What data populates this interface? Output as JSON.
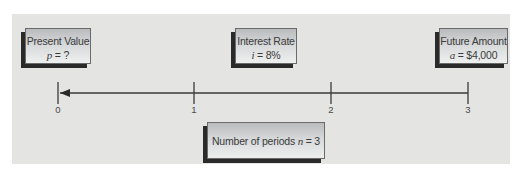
{
  "diagram": {
    "type": "time-value-of-money timeline",
    "boxes": {
      "present_value": {
        "title": "Present Value",
        "var": "p",
        "rest": " = ?"
      },
      "interest_rate": {
        "title": "Interest Rate",
        "var": "i",
        "rest": " = 8%"
      },
      "future_amount": {
        "title": "Future Amount",
        "var": "a",
        "rest": " = $4,000"
      },
      "periods": {
        "prefix": "Number of periods ",
        "var": "n",
        "rest": " = 3"
      }
    },
    "timeline": {
      "ticks": [
        "0",
        "1",
        "2",
        "3"
      ],
      "arrow_direction": "right-to-left"
    },
    "colors": {
      "panel_bg": "#e4e4e2",
      "line": "#3a3a3a",
      "box_shadow": "#2a2a2a"
    }
  }
}
